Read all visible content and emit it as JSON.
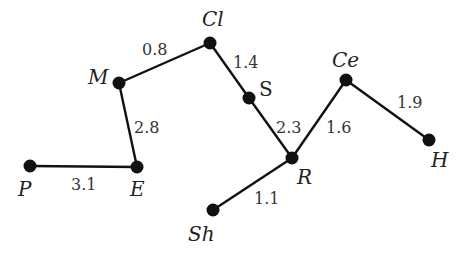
{
  "diagram": {
    "type": "weighted-tree",
    "nodes": [
      {
        "id": "P",
        "label": "P",
        "x": 30,
        "y": 166,
        "lx": 18,
        "ly": 196,
        "italic": true
      },
      {
        "id": "E",
        "label": "E",
        "x": 137,
        "y": 167,
        "lx": 130,
        "ly": 196,
        "italic": true
      },
      {
        "id": "M",
        "label": "M",
        "x": 119,
        "y": 83,
        "lx": 88,
        "ly": 84,
        "italic": true
      },
      {
        "id": "Cl",
        "label": "Cl",
        "x": 210,
        "y": 43,
        "lx": 202,
        "ly": 26,
        "italic": true
      },
      {
        "id": "S",
        "label": "S",
        "x": 249,
        "y": 98,
        "lx": 259,
        "ly": 96,
        "italic": false
      },
      {
        "id": "R",
        "label": "R",
        "x": 292,
        "y": 158,
        "lx": 297,
        "ly": 184,
        "italic": true
      },
      {
        "id": "Ce",
        "label": "Ce",
        "x": 346,
        "y": 80,
        "lx": 332,
        "ly": 67,
        "italic": true
      },
      {
        "id": "H",
        "label": "H",
        "x": 429,
        "y": 140,
        "lx": 431,
        "ly": 167,
        "italic": true
      },
      {
        "id": "Sh",
        "label": "Sh",
        "x": 213,
        "y": 210,
        "lx": 188,
        "ly": 241,
        "italic": true
      }
    ],
    "edges": [
      {
        "from": "P",
        "to": "E",
        "weight": "3.1",
        "wx": 71,
        "wy": 190
      },
      {
        "from": "E",
        "to": "M",
        "weight": "2.8",
        "wx": 134,
        "wy": 133
      },
      {
        "from": "M",
        "to": "Cl",
        "weight": "0.8",
        "wx": 142,
        "wy": 55
      },
      {
        "from": "Cl",
        "to": "S",
        "weight": "1.4",
        "wx": 233,
        "wy": 68
      },
      {
        "from": "S",
        "to": "R",
        "weight": "2.3",
        "wx": 276,
        "wy": 133
      },
      {
        "from": "R",
        "to": "Ce",
        "weight": "1.6",
        "wx": 326,
        "wy": 133
      },
      {
        "from": "Ce",
        "to": "H",
        "weight": "1.9",
        "wx": 397,
        "wy": 108
      },
      {
        "from": "R",
        "to": "Sh",
        "weight": "1.1",
        "wx": 254,
        "wy": 204
      }
    ]
  }
}
